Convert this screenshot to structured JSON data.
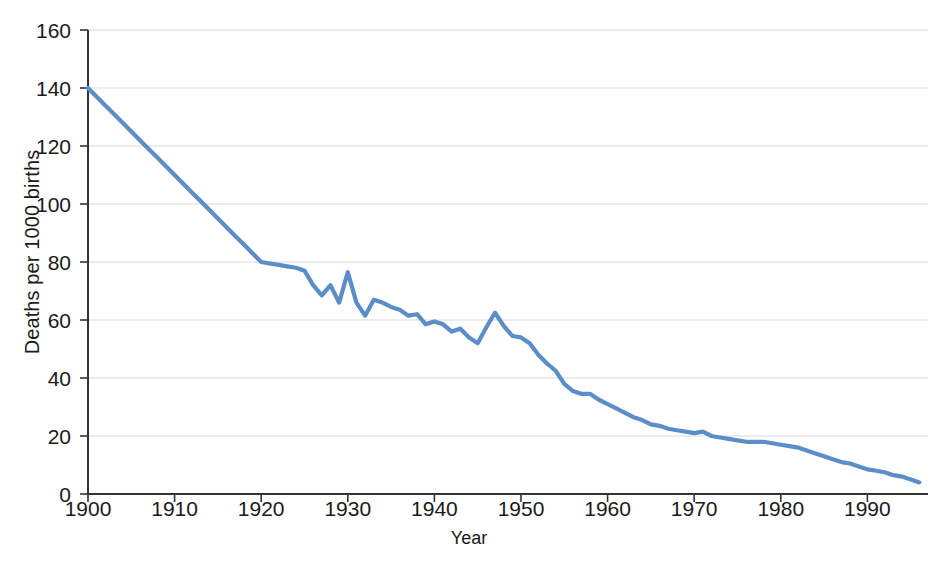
{
  "chart_data": {
    "type": "line",
    "title": "",
    "xlabel": "Year",
    "ylabel": "Deaths per 1000 births",
    "xlim": [
      1900,
      1997
    ],
    "ylim": [
      0,
      160
    ],
    "grid": true,
    "legend": false,
    "legend_position": "none",
    "line_color": "#5b8dc8",
    "axis_color": "#333333",
    "grid_color": "#d9d9d9",
    "background_color": "#ffffff",
    "x_ticks": [
      1900,
      1910,
      1920,
      1930,
      1940,
      1950,
      1960,
      1970,
      1980,
      1990
    ],
    "x_tick_labels": [
      "1900",
      "1910",
      "1920",
      "1930",
      "1940",
      "1950",
      "1960",
      "1970",
      "1980",
      "1990"
    ],
    "y_ticks": [
      0,
      20,
      40,
      60,
      80,
      100,
      120,
      140,
      160
    ],
    "y_tick_labels": [
      "0",
      "20",
      "40",
      "60",
      "80",
      "100",
      "120",
      "140",
      "160"
    ],
    "series_name": "Infant deaths per 1000 births",
    "x": [
      1900,
      1901,
      1902,
      1903,
      1904,
      1905,
      1906,
      1907,
      1908,
      1909,
      1910,
      1911,
      1912,
      1913,
      1914,
      1915,
      1916,
      1917,
      1918,
      1919,
      1920,
      1921,
      1922,
      1923,
      1924,
      1925,
      1926,
      1927,
      1928,
      1929,
      1930,
      1931,
      1932,
      1933,
      1934,
      1935,
      1936,
      1937,
      1938,
      1939,
      1940,
      1941,
      1942,
      1943,
      1944,
      1945,
      1946,
      1947,
      1948,
      1949,
      1950,
      1951,
      1952,
      1953,
      1954,
      1955,
      1956,
      1957,
      1958,
      1959,
      1960,
      1961,
      1962,
      1963,
      1964,
      1965,
      1966,
      1967,
      1968,
      1969,
      1970,
      1971,
      1972,
      1973,
      1974,
      1975,
      1976,
      1977,
      1978,
      1979,
      1980,
      1981,
      1982,
      1983,
      1984,
      1985,
      1986,
      1987,
      1988,
      1989,
      1990,
      1991,
      1992,
      1993,
      1994,
      1995,
      1996
    ],
    "y": [
      140.0,
      137.0,
      134.0,
      131.0,
      128.0,
      125.0,
      122.0,
      119.0,
      116.0,
      113.0,
      110.0,
      107.0,
      104.0,
      101.0,
      98.0,
      95.0,
      92.0,
      89.0,
      86.0,
      83.0,
      80.0,
      79.5,
      79.0,
      78.5,
      78.0,
      77.0,
      72.0,
      68.5,
      72.0,
      66.0,
      76.5,
      66.0,
      61.5,
      67.0,
      66.0,
      64.5,
      63.5,
      61.5,
      62.0,
      58.5,
      59.5,
      58.5,
      56.0,
      57.0,
      54.0,
      52.0,
      57.5,
      62.5,
      58.0,
      54.5,
      54.0,
      52.0,
      48.0,
      45.0,
      42.5,
      38.0,
      35.5,
      34.5,
      34.5,
      32.5,
      31.0,
      29.5,
      28.0,
      26.5,
      25.5,
      24.0,
      23.5,
      22.5,
      22.0,
      21.5,
      21.0,
      21.5,
      20.0,
      19.5,
      19.0,
      18.5,
      18.0,
      18.0,
      18.0,
      17.5,
      17.0,
      16.5,
      16.0,
      15.0,
      14.0,
      13.0,
      12.0,
      11.0,
      10.5,
      9.5,
      8.5,
      8.0,
      7.5,
      6.5,
      6.0,
      5.0,
      4.0
    ],
    "annotations": [
      {
        "label": "peak",
        "x": 1930,
        "y": 76.5
      },
      {
        "label": "peak",
        "x": 1947,
        "y": 62.5
      }
    ]
  },
  "axes": {
    "y_title": "Deaths per 1000 births",
    "x_title": "Year"
  }
}
